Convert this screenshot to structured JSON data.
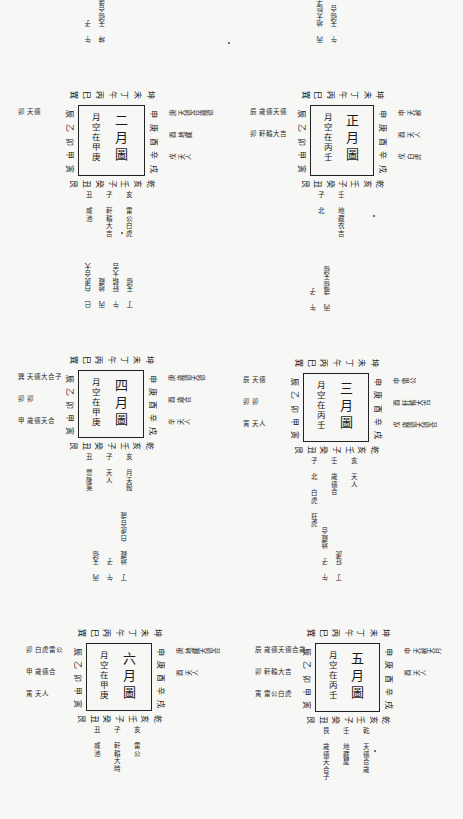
{
  "page": {
    "background": "#f7f7f5",
    "ink": "#1a1a1a",
    "orientation": "rotated-90-clockwise"
  },
  "diagrams": [
    {
      "id": "m1",
      "title": "正月圖",
      "note": "月空在丙壬",
      "box": {
        "x": 310,
        "y": 105,
        "w": 62,
        "h": 69
      },
      "top": [
        "巽",
        "巳",
        "丙",
        "午",
        "丁",
        "未",
        "坤"
      ],
      "right": [
        "申",
        "庚",
        "酉",
        "辛",
        "戌"
      ],
      "bottom": [
        "艮",
        "丑",
        "癸",
        "子",
        "壬",
        "亥",
        "乾"
      ],
      "left": [
        "辰",
        "乙",
        "卯",
        "甲",
        "寅"
      ],
      "annotations": {
        "top": [
          "丙 地太陰子",
          "午 天德合"
        ],
        "right": [
          "申 天赦",
          "酉 天人",
          "戌 白虎"
        ],
        "bottom": [
          "子 北",
          "壬 地藏衣吉"
        ],
        "left": [
          "辰 歲德天德",
          "卯 軒轅大吉"
        ]
      }
    },
    {
      "id": "m2",
      "title": "二月圖",
      "note": "月空在甲庚",
      "box": {
        "x": 78,
        "y": 105,
        "w": 65,
        "h": 69
      },
      "top": [
        "巽",
        "巳",
        "丙",
        "午",
        "丁",
        "未",
        "坤"
      ],
      "right": [
        "申",
        "庚",
        "酉",
        "辛",
        "戌"
      ],
      "bottom": [
        "艮",
        "丑",
        "癸",
        "子",
        "壬",
        "亥",
        "乾"
      ],
      "left": [
        "辰",
        "乙",
        "卯",
        "甲",
        "寅"
      ],
      "annotations": {
        "top": [
          "午 子",
          "坤 天德合歲德"
        ],
        "right": [
          "庚 天德合歲德",
          "酉 地藏",
          "戌 天人"
        ],
        "bottom": [
          "丑 咸池",
          "子 軒轅大吉",
          "亥 雷公白虎"
        ],
        "left": [
          "卯 天德"
        ]
      }
    },
    {
      "id": "m3",
      "title": "三月圖",
      "note": "月空在丙壬",
      "box": {
        "x": 303,
        "y": 373,
        "w": 64,
        "h": 67
      },
      "top": [
        "巽",
        "巳",
        "丙",
        "午",
        "丁",
        "未",
        "坤"
      ],
      "right": [
        "申",
        "庚",
        "酉",
        "辛",
        "戌"
      ],
      "bottom": [
        "艮",
        "丑",
        "癸",
        "子",
        "壬",
        "亥",
        "乾"
      ],
      "left": [
        "辰",
        "乙",
        "卯",
        "甲",
        "寅"
      ],
      "annotations": {
        "top": [
          "午 子",
          "丙 歲德天德"
        ],
        "right": [
          "申 雷公",
          "酉 軒轅大吉",
          "戌 歲德天德合"
        ],
        "bottom": [
          "子 北 白虎 狂虎",
          "壬 歲德合",
          "亥 天人"
        ],
        "left": [
          "辰 天德",
          "卯 卯",
          "寅 天人"
        ]
      }
    },
    {
      "id": "m4",
      "title": "四月圖",
      "note": "月空在甲庚",
      "box": {
        "x": 78,
        "y": 370,
        "w": 64,
        "h": 66
      },
      "top": [
        "巽",
        "巳",
        "丙",
        "午",
        "丁",
        "未",
        "坤"
      ],
      "right": [
        "申",
        "庚",
        "酉",
        "辛",
        "戌"
      ],
      "bottom": [
        "艮",
        "丑",
        "癸",
        "子",
        "壬",
        "亥",
        "乾"
      ],
      "left": [
        "辰",
        "乙",
        "卯",
        "甲",
        "寅"
      ],
      "annotations": {
        "top": [
          "巳 白虎合大",
          "丙 地藏",
          "午 軒轅大吉",
          "丁 天德"
        ],
        "right": [
          "庚 歲德天德",
          "酉 歲合",
          "辛 天人"
        ],
        "bottom": [
          "丑 豐隆吳",
          "子 天人",
          "亥 月天殺"
        ],
        "left": [
          "巽 天德大合子",
          "卯 卯",
          "甲 歲德天合"
        ]
      }
    },
    {
      "id": "m5",
      "title": "五月圖",
      "note": "月空在丙壬",
      "box": {
        "x": 315,
        "y": 643,
        "w": 63,
        "h": 67
      },
      "top": [
        "巽",
        "巳",
        "丙",
        "午",
        "丁",
        "未",
        "坤"
      ],
      "right": [
        "申",
        "庚",
        "酉",
        "辛",
        "戌"
      ],
      "bottom": [
        "艮",
        "丑",
        "癸",
        "子",
        "壬",
        "亥",
        "乾"
      ],
      "left": [
        "辰",
        "乙",
        "卯",
        "甲",
        "寅"
      ],
      "annotations": {
        "top": [
          "午 子 地藏合",
          "丁 狂虎"
        ],
        "right": [
          "申 天赦天月",
          "酉 天人"
        ],
        "bottom": [
          "艮 歲德天合子",
          "壬 地藏屋",
          "乾 天德合歲"
        ],
        "left": [
          "辰 歲德天德合歲",
          "卯 軒轅大吉",
          "寅 雷公白虎"
        ]
      }
    },
    {
      "id": "m6",
      "title": "六月圖",
      "note": "月空在甲庚",
      "box": {
        "x": 86,
        "y": 643,
        "w": 64,
        "h": 66
      },
      "top": [
        "巽",
        "巳",
        "丙",
        "午",
        "丁",
        "未",
        "坤"
      ],
      "right": [
        "申",
        "庚",
        "酉",
        "辛",
        "戌"
      ],
      "bottom": [
        "艮",
        "丑",
        "癸",
        "子",
        "壬",
        "亥",
        "乾"
      ],
      "left": [
        "辰",
        "乙",
        "卯",
        "甲",
        "寅"
      ],
      "annotations": {
        "top": [
          "丙 天德",
          "午 子",
          "丁 地藏 白虎合歲"
        ],
        "right": [
          "庚 地藏天德合",
          "酉 天人"
        ],
        "bottom": [
          "丑 咸池",
          "子 軒轅大時",
          "亥 雷公"
        ],
        "left": [
          "卯 白虎雷公",
          "甲 歲德合",
          "寅 天人"
        ]
      }
    }
  ]
}
